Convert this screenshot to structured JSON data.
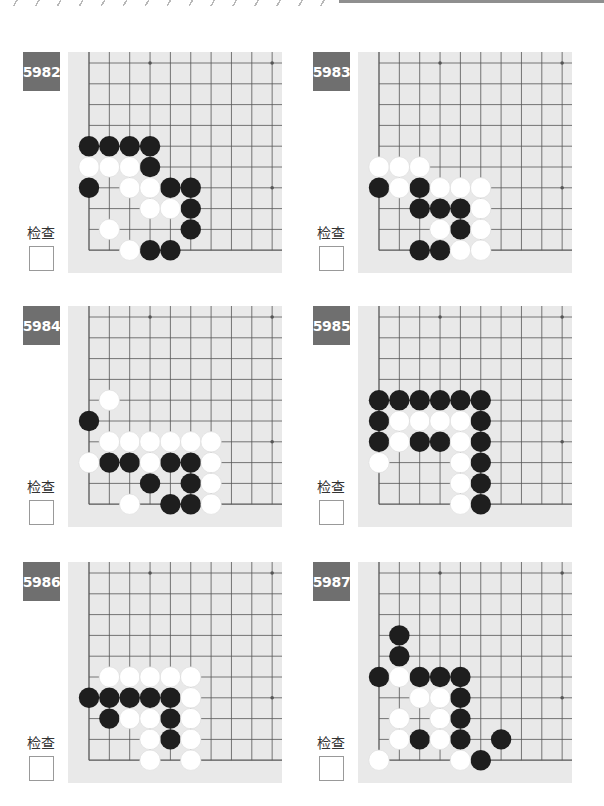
{
  "page": {
    "check_label": "检查"
  },
  "problems": [
    {
      "number": "5982",
      "black": [
        [
          0,
          4
        ],
        [
          1,
          4
        ],
        [
          2,
          4
        ],
        [
          3,
          4
        ],
        [
          3,
          5
        ],
        [
          0,
          6
        ],
        [
          4,
          6
        ],
        [
          5,
          6
        ],
        [
          5,
          7
        ],
        [
          5,
          8
        ],
        [
          3,
          9
        ],
        [
          4,
          9
        ]
      ],
      "white": [
        [
          0,
          5
        ],
        [
          1,
          5
        ],
        [
          2,
          5
        ],
        [
          2,
          6
        ],
        [
          3,
          6
        ],
        [
          3,
          7
        ],
        [
          4,
          7
        ],
        [
          1,
          8
        ],
        [
          2,
          9
        ]
      ]
    },
    {
      "number": "5983",
      "black": [
        [
          0,
          6
        ],
        [
          2,
          6
        ],
        [
          2,
          7
        ],
        [
          3,
          7
        ],
        [
          4,
          7
        ],
        [
          4,
          8
        ],
        [
          2,
          9
        ],
        [
          3,
          9
        ]
      ],
      "white": [
        [
          0,
          5
        ],
        [
          1,
          5
        ],
        [
          2,
          5
        ],
        [
          1,
          6
        ],
        [
          3,
          6
        ],
        [
          4,
          6
        ],
        [
          5,
          6
        ],
        [
          5,
          7
        ],
        [
          3,
          8
        ],
        [
          5,
          8
        ],
        [
          4,
          9
        ],
        [
          5,
          9
        ]
      ]
    },
    {
      "number": "5984",
      "black": [
        [
          0,
          5
        ],
        [
          1,
          7
        ],
        [
          2,
          7
        ],
        [
          4,
          7
        ],
        [
          5,
          7
        ],
        [
          3,
          8
        ],
        [
          5,
          8
        ],
        [
          4,
          9
        ],
        [
          5,
          9
        ]
      ],
      "white": [
        [
          1,
          4
        ],
        [
          1,
          6
        ],
        [
          2,
          6
        ],
        [
          3,
          6
        ],
        [
          4,
          6
        ],
        [
          5,
          6
        ],
        [
          6,
          6
        ],
        [
          0,
          7
        ],
        [
          3,
          7
        ],
        [
          6,
          7
        ],
        [
          6,
          8
        ],
        [
          2,
          9
        ],
        [
          6,
          9
        ]
      ]
    },
    {
      "number": "5985",
      "black": [
        [
          0,
          4
        ],
        [
          1,
          4
        ],
        [
          2,
          4
        ],
        [
          3,
          4
        ],
        [
          4,
          4
        ],
        [
          5,
          4
        ],
        [
          0,
          5
        ],
        [
          5,
          5
        ],
        [
          0,
          6
        ],
        [
          2,
          6
        ],
        [
          3,
          6
        ],
        [
          5,
          6
        ],
        [
          5,
          7
        ],
        [
          5,
          8
        ],
        [
          5,
          9
        ]
      ],
      "white": [
        [
          1,
          5
        ],
        [
          2,
          5
        ],
        [
          3,
          5
        ],
        [
          4,
          5
        ],
        [
          1,
          6
        ],
        [
          4,
          6
        ],
        [
          0,
          7
        ],
        [
          4,
          7
        ],
        [
          4,
          8
        ],
        [
          4,
          9
        ]
      ]
    },
    {
      "number": "5986",
      "black": [
        [
          0,
          6
        ],
        [
          1,
          6
        ],
        [
          2,
          6
        ],
        [
          3,
          6
        ],
        [
          4,
          6
        ],
        [
          1,
          7
        ],
        [
          4,
          7
        ],
        [
          4,
          8
        ]
      ],
      "white": [
        [
          1,
          5
        ],
        [
          2,
          5
        ],
        [
          3,
          5
        ],
        [
          4,
          5
        ],
        [
          5,
          5
        ],
        [
          5,
          6
        ],
        [
          2,
          7
        ],
        [
          3,
          7
        ],
        [
          5,
          7
        ],
        [
          3,
          8
        ],
        [
          5,
          8
        ],
        [
          3,
          9
        ],
        [
          5,
          9
        ]
      ]
    },
    {
      "number": "5987",
      "black": [
        [
          1,
          3
        ],
        [
          1,
          4
        ],
        [
          0,
          5
        ],
        [
          2,
          5
        ],
        [
          3,
          5
        ],
        [
          4,
          5
        ],
        [
          4,
          6
        ],
        [
          4,
          7
        ],
        [
          2,
          8
        ],
        [
          4,
          8
        ],
        [
          6,
          8
        ],
        [
          5,
          9
        ]
      ],
      "white": [
        [
          1,
          5
        ],
        [
          2,
          6
        ],
        [
          3,
          6
        ],
        [
          1,
          7
        ],
        [
          3,
          7
        ],
        [
          1,
          8
        ],
        [
          3,
          8
        ],
        [
          0,
          9
        ],
        [
          4,
          9
        ]
      ]
    }
  ],
  "board": {
    "cols": 10,
    "rows": 10,
    "hoshi": [
      [
        3,
        0
      ],
      [
        9,
        0
      ],
      [
        9,
        6
      ]
    ],
    "colors": {
      "board_bg": "#e9e9e9",
      "line": "#555555",
      "black_stone": "#1e1e1e",
      "white_stone": "#ffffff",
      "label_bg": "#6f6f6f"
    }
  }
}
